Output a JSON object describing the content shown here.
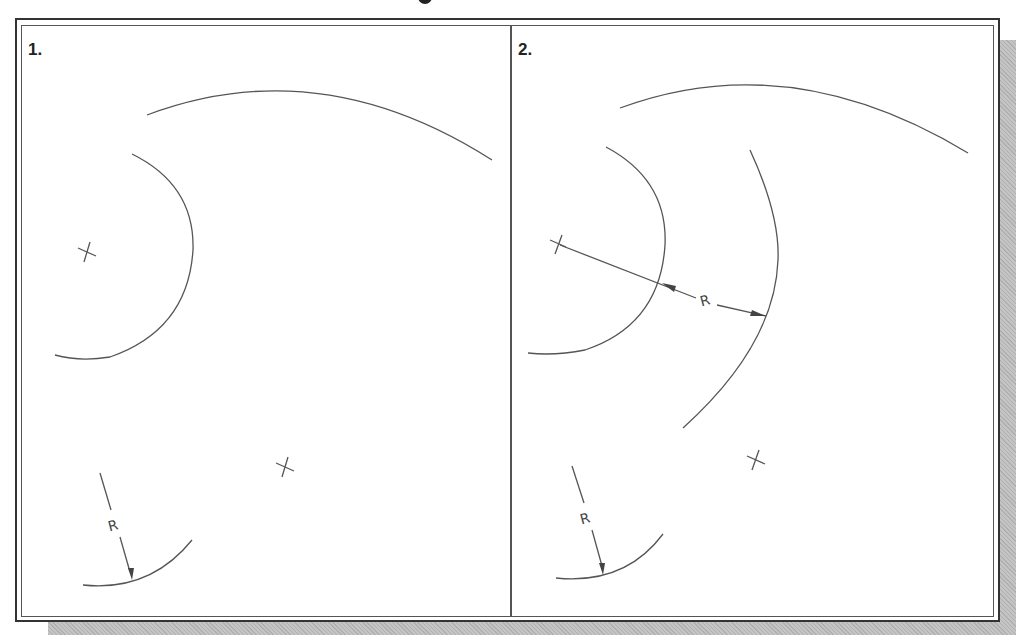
{
  "figure": {
    "panels": [
      {
        "label": "1.",
        "dimension_text": "R"
      },
      {
        "label": "2.",
        "dimension_text_outer": "R",
        "dimension_text_lower": "R"
      }
    ]
  },
  "colors": {
    "line": "#555555",
    "frame": "#333333",
    "shadow": "#b8b8b8",
    "background": "#ffffff"
  }
}
